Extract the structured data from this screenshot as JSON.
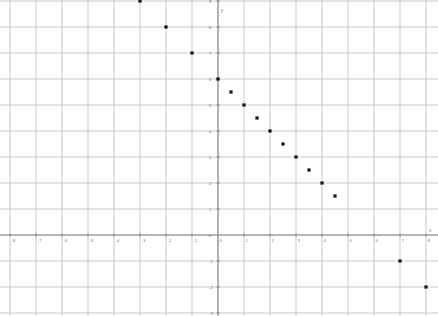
{
  "chart_data": {
    "type": "scatter",
    "title": "",
    "xlabel": "x",
    "ylabel": "y",
    "xlim": [
      -8.6,
      8.6
    ],
    "ylim": [
      -3.2,
      9.6
    ],
    "grid": true,
    "legend": null,
    "x_ticks": [
      -8,
      -7,
      -6,
      -5,
      -4,
      -3,
      -2,
      -1,
      0,
      1,
      2,
      3,
      4,
      5,
      6,
      7,
      8
    ],
    "y_ticks": [
      -3,
      -2,
      -1,
      0,
      1,
      2,
      3,
      4,
      5,
      6,
      7,
      8,
      9
    ],
    "x_tick_labels": [
      "-8",
      "-7",
      "-6",
      "-5",
      "-4",
      "-3",
      "-2",
      "-1",
      "0",
      "1",
      "2",
      "3",
      "4",
      "5",
      "6",
      "7",
      "8"
    ],
    "y_tick_labels": [
      "-3",
      "-2",
      "-1",
      "0",
      "1",
      "2",
      "3",
      "4",
      "5",
      "6",
      "7",
      "8",
      "9"
    ],
    "series": [
      {
        "name": "points",
        "marker": "square",
        "color": "#121212",
        "points": [
          {
            "x": -3,
            "y": 9
          },
          {
            "x": -2,
            "y": 8
          },
          {
            "x": -1,
            "y": 7
          },
          {
            "x": 0,
            "y": 6
          },
          {
            "x": 0.5,
            "y": 5.5
          },
          {
            "x": 1,
            "y": 5
          },
          {
            "x": 1.5,
            "y": 4.5
          },
          {
            "x": 2,
            "y": 4
          },
          {
            "x": 2.5,
            "y": 3.5
          },
          {
            "x": 3,
            "y": 3
          },
          {
            "x": 3.5,
            "y": 2.5
          },
          {
            "x": 4,
            "y": 2
          },
          {
            "x": 4.5,
            "y": 1.5
          },
          {
            "x": 7,
            "y": -1
          },
          {
            "x": 8,
            "y": -2
          }
        ]
      }
    ]
  },
  "axes": {
    "x_axis_label": "x",
    "y_axis_label": "y"
  }
}
